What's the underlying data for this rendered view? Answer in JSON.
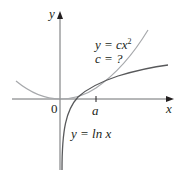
{
  "figure": {
    "axes": {
      "x_label": "x",
      "y_label": "y",
      "origin_label": "0",
      "tick_label": "a"
    },
    "curves": [
      {
        "name": "parabola",
        "equation_lhs": "y = cx",
        "exponent": "2",
        "color": "#a7a9ac"
      },
      {
        "name": "logarithm",
        "equation": "y = ln x",
        "color": "#58595b"
      }
    ],
    "question": "c = ?",
    "colors": {
      "axis": "#231f20",
      "text": "#231f20"
    }
  }
}
